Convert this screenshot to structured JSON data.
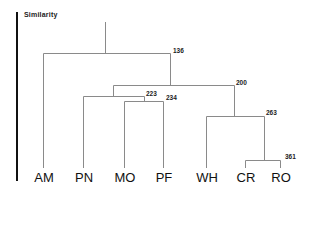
{
  "title": "Similarity",
  "leaves": [
    {
      "label": "AM",
      "x": 43
    },
    {
      "label": "PN",
      "x": 83
    },
    {
      "label": "MO",
      "x": 124
    },
    {
      "label": "PF",
      "x": 163
    },
    {
      "label": "WH",
      "x": 206
    },
    {
      "label": "CR",
      "x": 245
    },
    {
      "label": "RO",
      "x": 280
    }
  ],
  "nodes": [
    {
      "id": "root",
      "value": "",
      "members": [
        "AM",
        "PN",
        "MO",
        "PF",
        "WH",
        "CR",
        "RO"
      ]
    },
    {
      "id": "n136",
      "value": "136",
      "members": [
        "PN",
        "MO",
        "PF",
        "WH",
        "CR",
        "RO"
      ]
    },
    {
      "id": "n223",
      "value": "223",
      "members": [
        "PN",
        "MO",
        "PF"
      ]
    },
    {
      "id": "n234",
      "value": "234",
      "members": [
        "MO",
        "PF"
      ]
    },
    {
      "id": "n200",
      "value": "200",
      "members": [
        "WH",
        "CR",
        "RO"
      ]
    },
    {
      "id": "n263",
      "value": "263",
      "members": [
        "CR",
        "RO"
      ]
    },
    {
      "id": "n361",
      "value": "361",
      "members": [
        "CR",
        "RO"
      ]
    }
  ],
  "colors": {
    "line": "#8a8a8a",
    "axis": "#111111",
    "text": "#222222"
  }
}
